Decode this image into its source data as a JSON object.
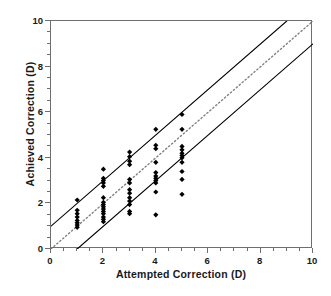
{
  "chart_data": {
    "type": "scatter",
    "title": "",
    "xlabel": "Attempted Correction (D)",
    "ylabel": "Achieved Correction (D)",
    "xlim": [
      0,
      10
    ],
    "ylim": [
      0,
      10
    ],
    "xticks": [
      0,
      2,
      4,
      6,
      8,
      10
    ],
    "yticks": [
      0,
      2,
      4,
      6,
      8,
      10
    ],
    "xtick_labels": [
      "0",
      "2",
      "4",
      "6",
      "8",
      "10"
    ],
    "ytick_labels": [
      "0",
      "2",
      "4",
      "6",
      "8",
      "10"
    ],
    "minor_tick_step": 0.5,
    "grid": false,
    "legend": "none",
    "marker": "filled-diamond",
    "marker_color": "#000000",
    "series": [
      {
        "name": "Eyes",
        "points": [
          [
            1,
            2.15
          ],
          [
            1,
            1.7
          ],
          [
            1,
            1.55
          ],
          [
            1,
            1.4
          ],
          [
            1,
            1.25
          ],
          [
            1,
            1.15
          ],
          [
            1,
            1.05
          ],
          [
            1,
            0.95
          ],
          [
            2,
            3.5
          ],
          [
            2,
            3.1
          ],
          [
            2,
            3.0
          ],
          [
            2,
            2.9
          ],
          [
            2,
            2.75
          ],
          [
            2,
            2.25
          ],
          [
            2,
            2.05
          ],
          [
            2,
            1.95
          ],
          [
            2,
            1.85
          ],
          [
            2,
            1.75
          ],
          [
            2,
            1.65
          ],
          [
            2,
            1.55
          ],
          [
            2,
            1.4
          ],
          [
            2,
            1.3
          ],
          [
            2,
            1.2
          ],
          [
            3,
            4.25
          ],
          [
            3,
            4.05
          ],
          [
            3,
            3.85
          ],
          [
            3,
            3.7
          ],
          [
            3,
            3.05
          ],
          [
            3,
            2.9
          ],
          [
            3,
            2.6
          ],
          [
            3,
            2.45
          ],
          [
            3,
            2.25
          ],
          [
            3,
            2.1
          ],
          [
            3,
            1.95
          ],
          [
            3,
            1.65
          ],
          [
            3,
            1.55
          ],
          [
            4,
            5.25
          ],
          [
            4,
            4.55
          ],
          [
            4,
            4.4
          ],
          [
            4,
            3.8
          ],
          [
            4,
            3.35
          ],
          [
            4,
            3.2
          ],
          [
            4,
            3.1
          ],
          [
            4,
            3.0
          ],
          [
            4,
            2.9
          ],
          [
            4,
            2.5
          ],
          [
            4,
            1.5
          ],
          [
            5,
            5.9
          ],
          [
            5,
            5.25
          ],
          [
            5,
            4.5
          ],
          [
            5,
            4.35
          ],
          [
            5,
            4.2
          ],
          [
            5,
            4.1
          ],
          [
            5,
            4.0
          ],
          [
            5,
            3.8
          ],
          [
            5,
            3.4
          ],
          [
            5,
            3.05
          ],
          [
            5,
            2.4
          ]
        ]
      }
    ],
    "reference_lines": [
      {
        "name": "upper-limit-line",
        "style": "solid",
        "slope": 1,
        "intercept": 1,
        "color": "#000000"
      },
      {
        "name": "identity-line",
        "style": "dotted",
        "slope": 1,
        "intercept": 0,
        "color": "#808080"
      },
      {
        "name": "lower-limit-line",
        "style": "solid",
        "slope": 1,
        "intercept": -1,
        "color": "#000000"
      }
    ]
  },
  "colors": {
    "frame": "#6f6f6f",
    "text": "#1a1a1a",
    "marker": "#000000",
    "dotted_line": "#808080"
  }
}
